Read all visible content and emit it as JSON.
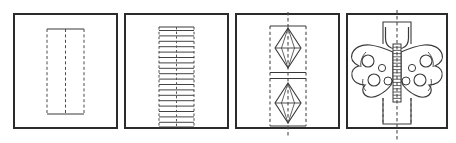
{
  "figure": {
    "canvas": {
      "width": 456,
      "height": 143
    },
    "colors": {
      "background": "#ffffff",
      "panel_fill": "#ffffff",
      "ink": "#3a3a3a",
      "ink_dark": "#2b2b2b",
      "dash": "#4a4a4a"
    },
    "stroke": {
      "frame_width": 2.0,
      "shape_width": 1.1,
      "detail_width": 0.9,
      "dash_pattern": "3 2.4",
      "dash_width": 1.0
    }
  },
  "panels": [
    {
      "id": "panel-1",
      "step_number": "1",
      "name": "flat-paper-strip",
      "caption": "",
      "frame": {
        "x": 14,
        "y": 14,
        "w": 103,
        "h": 114
      },
      "rect": {
        "x": 47,
        "y": 29,
        "w": 37,
        "h": 85
      },
      "center_line_x": 65.5,
      "center_line": {
        "y1": 29,
        "y2": 114
      },
      "edges": {
        "top_solid": true,
        "bottom_solid": true,
        "left_dashed": true,
        "right_dashed": true
      }
    },
    {
      "id": "panel-2",
      "step_number": "2",
      "name": "accordion-folded-strip",
      "caption": "",
      "frame": {
        "x": 125,
        "y": 14,
        "w": 103,
        "h": 114
      },
      "rect": {
        "x": 159,
        "y": 27,
        "w": 35,
        "h": 100
      },
      "center_line_x": 176.5,
      "fold_count": 18,
      "fold_lines": [
        30.5,
        35.9,
        41.3,
        46.7,
        52.1,
        57.5,
        62.9,
        68.3,
        73.7,
        79.1,
        84.5,
        89.9,
        95.3,
        100.7,
        106.1,
        111.5,
        116.9,
        122.3
      ]
    },
    {
      "id": "panel-3",
      "step_number": "3",
      "name": "cut-wing-outline",
      "caption": "",
      "frame": {
        "x": 236,
        "y": 14,
        "w": 103,
        "h": 114
      },
      "rect": {
        "x": 270,
        "y": 26,
        "w": 36,
        "h": 100
      },
      "center_line_x": 288,
      "center_line": {
        "y1": 12,
        "y2": 138
      },
      "diamonds": [
        {
          "cx": 288,
          "cy": 48,
          "rx": 13,
          "ry": 20
        },
        {
          "cx": 288,
          "cy": 103,
          "rx": 13,
          "ry": 20
        }
      ],
      "divider_lines": [
        72.5,
        78.5
      ],
      "divider_extent": {
        "x1": 270,
        "x2": 306
      }
    },
    {
      "id": "panel-4",
      "step_number": "4",
      "name": "finished-butterfly",
      "caption": "",
      "frame": {
        "x": 347,
        "y": 14,
        "w": 100,
        "h": 114
      },
      "center_line_x": 397,
      "center_line": {
        "y1": 10,
        "y2": 140
      },
      "top_tab": {
        "x": 383,
        "y": 22,
        "w": 28,
        "h": 22
      },
      "bottom_tab": {
        "x": 383,
        "y": 98,
        "w": 28,
        "h": 26
      },
      "body": {
        "x": 393,
        "y": 44,
        "w": 8,
        "h": 58
      },
      "body_segments": 17,
      "wing_spots_large": 4,
      "wing_spots_small": 4
    }
  ]
}
